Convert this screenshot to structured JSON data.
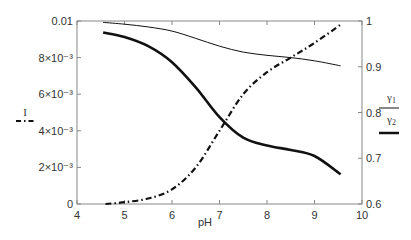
{
  "chart_data": {
    "type": "line",
    "title": "",
    "xlabel": "pH",
    "ylabel_left": "I",
    "ylabel_right": "γ1/γ2",
    "xlim": [
      4,
      10
    ],
    "ylim_left": [
      0,
      0.01
    ],
    "ylim_right": [
      0.6,
      1.0
    ],
    "x_ticks": [
      "4",
      "5",
      "6",
      "7",
      "8",
      "9",
      "10"
    ],
    "y_left_ticks": [
      "0",
      "2×10⁻³",
      "4×10⁻³",
      "6×10⁻³",
      "8×10⁻³",
      "0.01"
    ],
    "y_right_ticks": [
      "0.6",
      "0.7",
      "0.8",
      "0.9",
      "1"
    ],
    "grid": false,
    "legend": [
      {
        "label": "I",
        "style": "dash-dot",
        "axis": "left"
      },
      {
        "label": "γ1",
        "style": "thin solid",
        "axis": "right"
      },
      {
        "label": "γ2",
        "style": "thick solid",
        "axis": "right"
      }
    ],
    "series": [
      {
        "name": "I",
        "axis": "left",
        "style": "dash-dot",
        "x": [
          4.6,
          5.0,
          5.5,
          6.0,
          6.5,
          7.0,
          7.5,
          8.0,
          8.5,
          9.0,
          9.55
        ],
        "values": [
          0.0,
          0.0001,
          0.0003,
          0.0008,
          0.002,
          0.004,
          0.006,
          0.0072,
          0.008,
          0.0088,
          0.0098
        ]
      },
      {
        "name": "γ1",
        "axis": "right",
        "style": "thin",
        "x": [
          4.55,
          5.0,
          5.5,
          6.0,
          6.5,
          7.0,
          7.5,
          8.0,
          8.5,
          9.0,
          9.55
        ],
        "values": [
          0.997,
          0.993,
          0.987,
          0.978,
          0.962,
          0.945,
          0.932,
          0.925,
          0.92,
          0.913,
          0.902
        ]
      },
      {
        "name": "γ2",
        "axis": "right",
        "style": "thick",
        "x": [
          4.55,
          5.0,
          5.5,
          6.0,
          6.5,
          7.0,
          7.5,
          8.0,
          8.5,
          9.0,
          9.55
        ],
        "values": [
          0.975,
          0.965,
          0.945,
          0.91,
          0.855,
          0.79,
          0.745,
          0.728,
          0.718,
          0.705,
          0.665
        ]
      }
    ]
  },
  "labels": {
    "xlabel": "pH",
    "ylabel_left": "I",
    "gamma1": "γ",
    "gamma1_sub": "1",
    "gamma2": "γ",
    "gamma2_sub": "2"
  }
}
